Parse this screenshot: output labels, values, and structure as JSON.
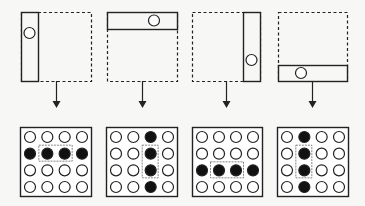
{
  "colors": {
    "background": "#f7f7f5",
    "stroke": "#222222",
    "fill_dark": "#111111",
    "fill_light": "#ffffff",
    "highlight_stroke": "#666666"
  },
  "panels": [
    {
      "id": "left",
      "frame": {
        "x": 21,
        "y": 12,
        "w": 70,
        "h": 69
      },
      "strip": {
        "x": 21,
        "y": 12,
        "w": 17,
        "h": 69
      },
      "marker": {
        "cx": 29.5,
        "cy": 33,
        "r": 5.5
      },
      "arrow": {
        "x": 56,
        "y1": 81,
        "y2": 108
      },
      "grid": {
        "frame": {
          "x": 20,
          "y": 127,
          "w": 71,
          "h": 69
        },
        "rows": [
          [
            0,
            0,
            0,
            0
          ],
          [
            1,
            1,
            1,
            1
          ],
          [
            0,
            0,
            0,
            0
          ],
          [
            0,
            0,
            0,
            0
          ]
        ],
        "highlight": {
          "col": 1,
          "row": 1,
          "cols": 2,
          "rows": 1
        }
      }
    },
    {
      "id": "top",
      "frame": {
        "x": 107,
        "y": 12,
        "w": 70,
        "h": 69
      },
      "strip": {
        "x": 107,
        "y": 12,
        "w": 70,
        "h": 17
      },
      "marker": {
        "cx": 154,
        "cy": 20.5,
        "r": 5.5
      },
      "arrow": {
        "x": 142,
        "y1": 81,
        "y2": 108
      },
      "grid": {
        "frame": {
          "x": 106,
          "y": 127,
          "w": 71,
          "h": 69
        },
        "rows": [
          [
            0,
            0,
            1,
            0
          ],
          [
            0,
            0,
            1,
            0
          ],
          [
            0,
            0,
            1,
            0
          ],
          [
            0,
            0,
            1,
            0
          ]
        ],
        "highlight": {
          "col": 2,
          "row": 1,
          "cols": 1,
          "rows": 2
        }
      }
    },
    {
      "id": "right",
      "frame": {
        "x": 192,
        "y": 12,
        "w": 68,
        "h": 69
      },
      "strip": {
        "x": 243,
        "y": 12,
        "w": 17,
        "h": 69
      },
      "marker": {
        "cx": 251.5,
        "cy": 60,
        "r": 5.5
      },
      "arrow": {
        "x": 226,
        "y1": 81,
        "y2": 108
      },
      "grid": {
        "frame": {
          "x": 192,
          "y": 127,
          "w": 70,
          "h": 69
        },
        "rows": [
          [
            0,
            0,
            0,
            0
          ],
          [
            0,
            0,
            0,
            0
          ],
          [
            1,
            1,
            1,
            1
          ],
          [
            0,
            0,
            0,
            0
          ]
        ],
        "highlight": {
          "col": 1,
          "row": 2,
          "cols": 2,
          "rows": 1
        }
      }
    },
    {
      "id": "bottom",
      "frame": {
        "x": 278,
        "y": 12,
        "w": 69,
        "h": 69
      },
      "strip": {
        "x": 278,
        "y": 65,
        "w": 69,
        "h": 16
      },
      "marker": {
        "cx": 301,
        "cy": 73,
        "r": 5.5
      },
      "arrow": {
        "x": 312,
        "y1": 81,
        "y2": 108
      },
      "grid": {
        "frame": {
          "x": 277,
          "y": 127,
          "w": 71,
          "h": 69
        },
        "rows": [
          [
            0,
            1,
            0,
            0
          ],
          [
            0,
            1,
            0,
            0
          ],
          [
            0,
            1,
            0,
            0
          ],
          [
            0,
            1,
            0,
            0
          ]
        ],
        "highlight": {
          "col": 1,
          "row": 1,
          "cols": 1,
          "rows": 2
        }
      }
    }
  ]
}
